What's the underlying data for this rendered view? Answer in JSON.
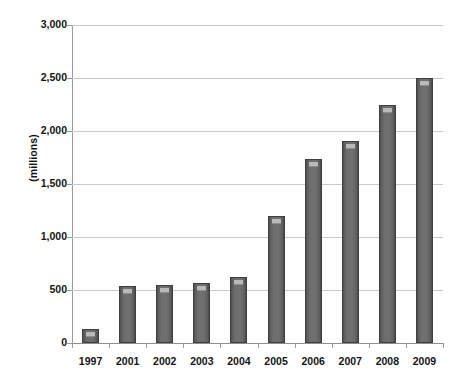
{
  "chart_data": {
    "type": "bar",
    "title": "",
    "subtitle": "",
    "xlabel": "",
    "ylabel": "(millions)",
    "categories": [
      "1997",
      "2001",
      "2002",
      "2003",
      "2004",
      "2005",
      "2006",
      "2007",
      "2008",
      "2009"
    ],
    "values": [
      130,
      540,
      545,
      570,
      625,
      1200,
      1740,
      1910,
      2250,
      2500
    ],
    "series": [
      {
        "name": "",
        "values": [
          130,
          540,
          545,
          570,
          625,
          1200,
          1740,
          1910,
          2250,
          2500
        ]
      }
    ],
    "ylim": [
      0,
      3000
    ],
    "ytick_values": [
      0,
      500,
      1000,
      1500,
      2000,
      2500,
      3000
    ],
    "ytick_labels": [
      "0",
      "500",
      "1,000",
      "1,500",
      "2,000",
      "2,500",
      "3,000"
    ],
    "grid": true,
    "grid_axis": "y",
    "legend": false,
    "legend_position": "none",
    "bar_color": "#6a6a6a",
    "bar_edge_color": "#3f3f3f",
    "bar_highlight_color": "#b9b9b9",
    "gridline_color": "#c9c9c9",
    "axis_color": "#9a9a9a",
    "text_color": "#141414",
    "background_color": "#ffffff",
    "annotations": []
  },
  "artifact": {
    "top_right_fragment": ""
  }
}
